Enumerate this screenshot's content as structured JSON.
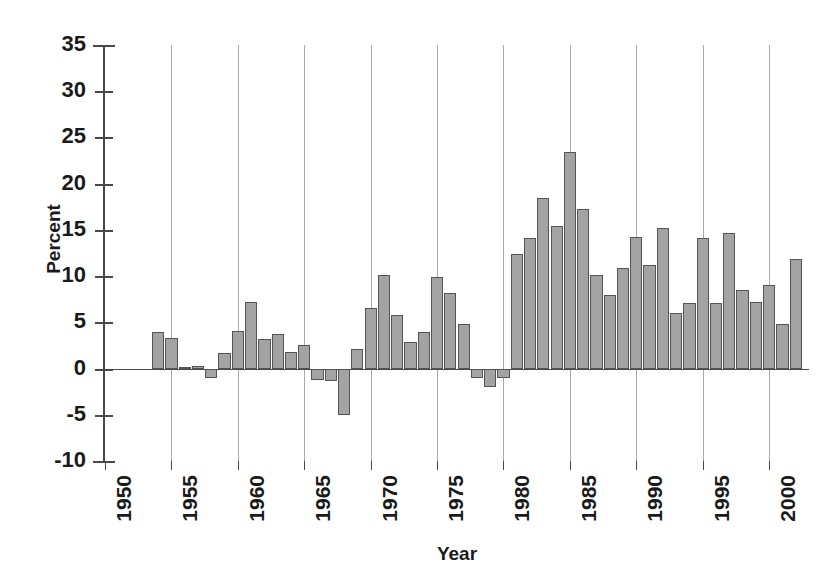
{
  "chart_data": {
    "type": "bar",
    "title": "",
    "subtitle": "",
    "xlabel": "Year",
    "ylabel": "Percent",
    "ylim": [
      -10,
      35
    ],
    "ytick_step": 5,
    "yticks": [
      35,
      30,
      25,
      20,
      15,
      10,
      5,
      0,
      -5,
      -10
    ],
    "ytick_labels": [
      "35",
      "30",
      "25",
      "20",
      "15",
      "10",
      "5",
      "0",
      "-5",
      "-10"
    ],
    "xlim": [
      1950,
      2003
    ],
    "xticks": [
      1950,
      1955,
      1960,
      1965,
      1970,
      1975,
      1980,
      1985,
      1990,
      1995,
      2000
    ],
    "xtick_labels": [
      "1950",
      "1955",
      "1960",
      "1965",
      "1970",
      "1975",
      "1980",
      "1985",
      "1990",
      "1995",
      "2000"
    ],
    "grid": "vertical-at-xticks",
    "legend": "none",
    "bar_color": "#a3a3a3",
    "bar_edge_color": "#555555",
    "axis_color": "#4a4a4a",
    "gridline_color": "#aaaaaa",
    "categories": [
      1954,
      1955,
      1956,
      1957,
      1958,
      1959,
      1960,
      1961,
      1962,
      1963,
      1964,
      1965,
      1966,
      1967,
      1968,
      1969,
      1970,
      1971,
      1972,
      1973,
      1974,
      1975,
      1976,
      1977,
      1978,
      1979,
      1980,
      1981,
      1982,
      1983,
      1984,
      1985,
      1986,
      1987,
      1988,
      1989,
      1990,
      1991,
      1992,
      1993,
      1994,
      1995,
      1996,
      1997,
      1998,
      1999,
      2000,
      2001,
      2002
    ],
    "values": [
      4.0,
      3.3,
      0.2,
      0.3,
      -1.0,
      1.7,
      4.1,
      7.2,
      3.2,
      3.7,
      1.8,
      2.5,
      -1.2,
      -1.3,
      -5.0,
      2.1,
      6.6,
      10.1,
      5.8,
      2.9,
      4.0,
      9.9,
      8.2,
      4.8,
      -1.0,
      -2.0,
      -1.0,
      12.4,
      14.1,
      18.5,
      15.4,
      23.4,
      17.3,
      10.1,
      8.0,
      10.9,
      14.2,
      11.2,
      15.2,
      6.0,
      7.1,
      14.1,
      7.1,
      14.7,
      8.5,
      7.2,
      9.0,
      4.8,
      11.9
    ]
  }
}
